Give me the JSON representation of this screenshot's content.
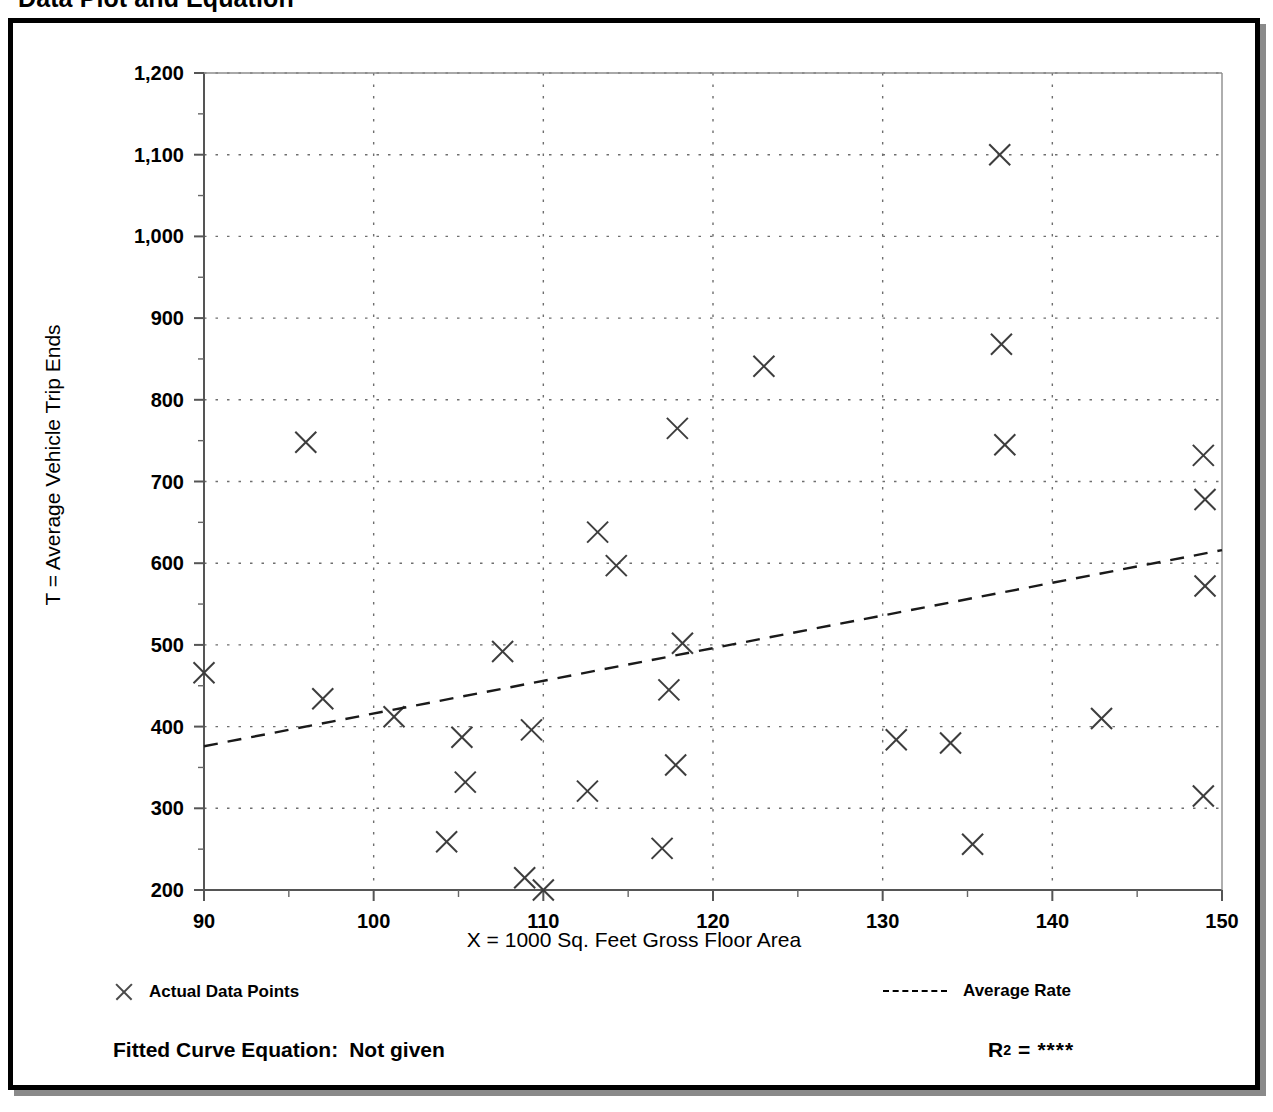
{
  "page": {
    "title": "Data Plot and Equation"
  },
  "legend": {
    "points_label": "Actual Data Points",
    "rate_label": "Average Rate",
    "fitted_prefix": "Fitted Curve Equation:",
    "fitted_value": "Not given",
    "r2_prefix": "R",
    "r2_exponent": "2",
    "r2_equals": "=",
    "r2_value": "****"
  },
  "chart_data": {
    "type": "scatter",
    "title": "Data Plot and Equation",
    "xlabel": "X = 1000 Sq. Feet Gross Floor Area",
    "ylabel": "T = Average Vehicle Trip Ends",
    "xlim": [
      90,
      150
    ],
    "ylim": [
      200,
      1200
    ],
    "xticks": [
      90,
      100,
      110,
      120,
      130,
      140,
      150
    ],
    "xtick_labels": [
      "90",
      "100",
      "110",
      "120",
      "130",
      "140",
      "150"
    ],
    "yticks": [
      200,
      300,
      400,
      500,
      600,
      700,
      800,
      900,
      1000,
      1100,
      1200
    ],
    "ytick_labels": [
      "200",
      "300",
      "400",
      "500",
      "600",
      "700",
      "800",
      "900",
      "1,000",
      "1,100",
      "1,200"
    ],
    "x_minor_step": 5,
    "y_minor_step": 50,
    "grid": "dotted-both",
    "legend_position": "below-axes",
    "series": [
      {
        "name": "Actual Data Points",
        "marker": "x",
        "points": [
          [
            90.0,
            466
          ],
          [
            96.0,
            748
          ],
          [
            97.0,
            434
          ],
          [
            101.2,
            412
          ],
          [
            104.3,
            259
          ],
          [
            105.2,
            387
          ],
          [
            105.4,
            332
          ],
          [
            107.6,
            492
          ],
          [
            108.9,
            215
          ],
          [
            109.3,
            396
          ],
          [
            110.0,
            200
          ],
          [
            112.6,
            321
          ],
          [
            113.2,
            638
          ],
          [
            114.3,
            597
          ],
          [
            117.0,
            251
          ],
          [
            117.4,
            445
          ],
          [
            117.8,
            353
          ],
          [
            117.9,
            765
          ],
          [
            118.2,
            502
          ],
          [
            123.0,
            841
          ],
          [
            130.8,
            384
          ],
          [
            134.0,
            380
          ],
          [
            135.3,
            256
          ],
          [
            136.9,
            1100
          ],
          [
            137.0,
            868
          ],
          [
            137.2,
            745
          ],
          [
            142.9,
            410
          ],
          [
            148.9,
            732
          ],
          [
            149.0,
            678
          ],
          [
            149.0,
            572
          ],
          [
            148.9,
            315
          ]
        ]
      },
      {
        "name": "Average Rate",
        "type": "line",
        "style": "dashed",
        "endpoints": [
          [
            90,
            376
          ],
          [
            150,
            616
          ]
        ]
      }
    ]
  }
}
